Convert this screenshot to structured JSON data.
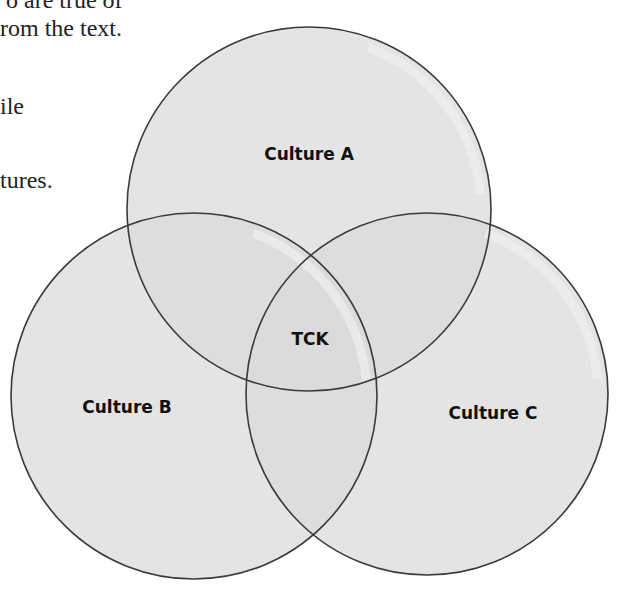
{
  "page_text": {
    "fragments": [
      {
        "text": "o are true of",
        "x": 6,
        "y": -12
      },
      {
        "text": "rom the text.",
        "x": 0,
        "y": 16
      },
      {
        "text": "ile",
        "x": 0,
        "y": 94
      },
      {
        "text": "tures.",
        "x": 0,
        "y": 168
      }
    ]
  },
  "diagram": {
    "type": "venn",
    "colors": {
      "fill": "#d9d9d9",
      "stroke": "#3a3a3a",
      "highlight": "#efefef"
    },
    "circles": [
      {
        "id": "culture-a",
        "label": "Culture A",
        "cx": 309,
        "cy": 209,
        "r": 182,
        "label_x": 309,
        "label_y": 160
      },
      {
        "id": "culture-b",
        "label": "Culture B",
        "cx": 194,
        "cy": 396,
        "r": 183,
        "label_x": 127,
        "label_y": 413
      },
      {
        "id": "culture-c",
        "label": "Culture C",
        "cx": 427,
        "cy": 394,
        "r": 181,
        "label_x": 493,
        "label_y": 419
      }
    ],
    "center_label": {
      "label": "TCK",
      "x": 310,
      "y": 345
    }
  }
}
